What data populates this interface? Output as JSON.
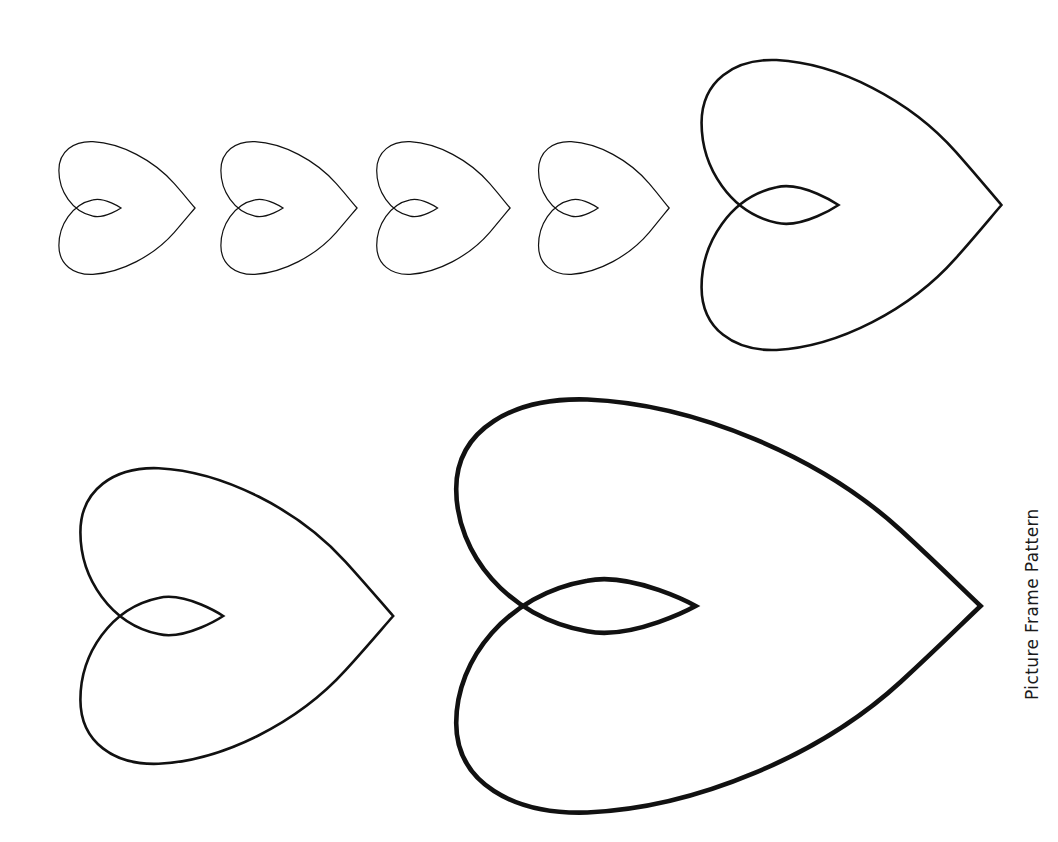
{
  "page": {
    "title": "Picture Frame Pattern",
    "background_color": "#ffffff",
    "width": 1058,
    "height": 842,
    "kind": "printable-craft-template"
  },
  "caption": {
    "text": "Picture Frame Pattern",
    "orientation": "vertical-rotated-90-ccw",
    "color": "#1a1a1a",
    "x": 1022,
    "y": 700
  },
  "shapes": {
    "icon_name": "heart-outline-icon",
    "shape_type": "heart",
    "rotation_degrees": 90,
    "fill_color": "#ffffff",
    "stroke_color": "#111111",
    "count": 7,
    "items": [
      {
        "id": "heart-small-1",
        "label": "Small heart 1",
        "size": "small",
        "x": 50,
        "y": 138,
        "width": 148,
        "height": 140,
        "stroke_width": 1.2
      },
      {
        "id": "heart-small-2",
        "label": "Small heart 2",
        "size": "small",
        "x": 212,
        "y": 138,
        "width": 148,
        "height": 140,
        "stroke_width": 1.2
      },
      {
        "id": "heart-small-3",
        "label": "Small heart 3",
        "size": "small",
        "x": 368,
        "y": 138,
        "width": 145,
        "height": 140,
        "stroke_width": 1.2
      },
      {
        "id": "heart-small-4",
        "label": "Small heart 4",
        "size": "small",
        "x": 530,
        "y": 138,
        "width": 142,
        "height": 140,
        "stroke_width": 1.2
      },
      {
        "id": "heart-medium-top-right",
        "label": "Medium heart top right",
        "size": "medium",
        "x": 682,
        "y": 52,
        "width": 326,
        "height": 306,
        "stroke_width": 2.6
      },
      {
        "id": "heart-medium-bottom-left",
        "label": "Medium heart bottom left",
        "size": "medium",
        "x": 60,
        "y": 460,
        "width": 340,
        "height": 312,
        "stroke_width": 2.6
      },
      {
        "id": "heart-large",
        "label": "Large heart",
        "size": "large",
        "x": 422,
        "y": 388,
        "width": 570,
        "height": 436,
        "stroke_width": 4.6
      }
    ]
  }
}
